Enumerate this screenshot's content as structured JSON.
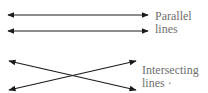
{
  "diagram": {
    "line_color": "#1a1a1a",
    "label_color": "#6f6f6f",
    "parallel": {
      "label_line1": "Parallel",
      "label_line2": "lines",
      "lines": [
        {
          "x1": 8,
          "y1": 15,
          "x2": 148,
          "y2": 15
        },
        {
          "x1": 8,
          "y1": 31,
          "x2": 148,
          "y2": 31
        }
      ]
    },
    "intersecting": {
      "label_line1": "Intersecting",
      "label_line2": "lines ·",
      "lines": [
        {
          "x1": 9,
          "y1": 61,
          "x2": 136,
          "y2": 90
        },
        {
          "x1": 9,
          "y1": 90,
          "x2": 136,
          "y2": 61
        }
      ]
    }
  }
}
